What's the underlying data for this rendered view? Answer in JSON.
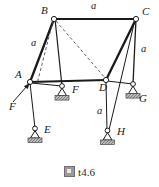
{
  "figure": {
    "caption": "t4.6",
    "caption_glyph": "square-glyph-icon",
    "nodes": [
      {
        "id": "A",
        "label": "A",
        "x": 30,
        "y": 82,
        "type": "joint"
      },
      {
        "id": "B",
        "label": "B",
        "x": 54,
        "y": 19,
        "type": "joint"
      },
      {
        "id": "C",
        "label": "C",
        "x": 136,
        "y": 19,
        "type": "joint"
      },
      {
        "id": "D",
        "label": "D",
        "x": 106,
        "y": 80,
        "type": "joint"
      },
      {
        "id": "E",
        "label": "E",
        "x": 35,
        "y": 133,
        "type": "support"
      },
      {
        "id": "F",
        "label": "F",
        "x": 63,
        "y": 90,
        "type": "support"
      },
      {
        "id": "G",
        "label": "G",
        "x": 133,
        "y": 88,
        "type": "support"
      },
      {
        "id": "H",
        "label": "H",
        "x": 107,
        "y": 135,
        "type": "support"
      }
    ],
    "dimension_labels": [
      {
        "text": "a",
        "x": 92,
        "y": 4,
        "member": "BC"
      },
      {
        "text": "a",
        "x": 33,
        "y": 42,
        "member": "AB"
      },
      {
        "text": "a",
        "x": 141,
        "y": 47,
        "member": "CD-vertical"
      },
      {
        "text": "a",
        "x": 99,
        "y": 110,
        "member": "DH"
      }
    ],
    "node_labels": [
      {
        "text": "B",
        "x": 42,
        "y": 11
      },
      {
        "text": "C",
        "x": 143,
        "y": 12
      },
      {
        "text": "A",
        "x": 16,
        "y": 74
      },
      {
        "text": "D",
        "x": 100,
        "y": 85
      },
      {
        "text": "F",
        "x": 74,
        "y": 87
      },
      {
        "text": "G",
        "x": 140,
        "y": 95
      },
      {
        "text": "E",
        "x": 43,
        "y": 127
      },
      {
        "text": "H",
        "x": 116,
        "y": 130
      }
    ],
    "force": {
      "label": "F",
      "label_x": 11,
      "label_y": 104,
      "arrow_tail_x": 13,
      "arrow_tail_y": 102,
      "arrow_head_x": 28,
      "arrow_head_y": 85,
      "applied_at": "A"
    },
    "colors": {
      "line": "#1a1a1a",
      "dashed": "#555555",
      "ground_hatch": "#8f8f8f",
      "joint_fill": "#ffffff",
      "text": "#1a1a1a"
    }
  }
}
